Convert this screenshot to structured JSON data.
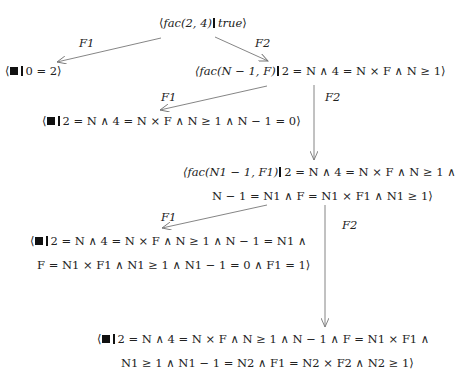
{
  "diagram": {
    "type": "derivation-tree",
    "nodes": {
      "root": {
        "text": "⟨fac(2, 4) ▍true⟩",
        "goal": "fac(2, 4)",
        "constraint": "true"
      },
      "n1_fail": {
        "goal": "■",
        "constraint": "0 = 2⟩",
        "prefix": "⟨"
      },
      "n1_cont": {
        "goal": "⟨fac(N − 1, F)",
        "constraint": "2 = N ∧ 4 = N × F ∧ N ≥ 1⟩"
      },
      "n2_fail": {
        "goal": "■",
        "constraint": "2 = N ∧ 4 = N × F ∧ N ≥ 1 ∧ N − 1 = 0⟩",
        "prefix": "⟨"
      },
      "n2_cont": {
        "goal": "⟨fac(N1 − 1, F1)",
        "constraint_line1": "2 = N ∧ 4 = N × F ∧ N ≥ 1 ∧",
        "constraint_line2": "N − 1 = N1 ∧ F = N1 × F1 ∧ N1 ≥ 1⟩"
      },
      "n3_fail": {
        "goal": "■",
        "prefix": "⟨",
        "constraint_line1": "2 = N ∧ 4 = N × F ∧ N ≥ 1 ∧ N − 1 = N1 ∧",
        "constraint_line2": "F = N1 × F1 ∧ N1 ≥ 1 ∧ N1 − 1 = 0 ∧ F1 = 1⟩"
      },
      "n3_cont": {
        "goal": "■",
        "prefix": "⟨",
        "constraint_line1": "2 = N ∧ 4 = N × F ∧ N ≥ 1 ∧ N − 1 ∧ F = N1 × F1 ∧",
        "constraint_line2": "N1 ≥ 1 ∧ N1 − 1 = N2 ∧ F1 = N2 × F2 ∧ N2 ≥ 1⟩"
      }
    },
    "edges": [
      {
        "from": "root",
        "to": "n1_fail",
        "label": "F1"
      },
      {
        "from": "root",
        "to": "n1_cont",
        "label": "F2"
      },
      {
        "from": "n1_cont",
        "to": "n2_fail",
        "label": "F1"
      },
      {
        "from": "n1_cont",
        "to": "n2_cont",
        "label": "F2"
      },
      {
        "from": "n2_cont",
        "to": "n3_fail",
        "label": "F1"
      },
      {
        "from": "n2_cont",
        "to": "n3_cont",
        "label": "F2"
      }
    ],
    "colors": {
      "edge": "#777777",
      "text": "#222222"
    }
  }
}
